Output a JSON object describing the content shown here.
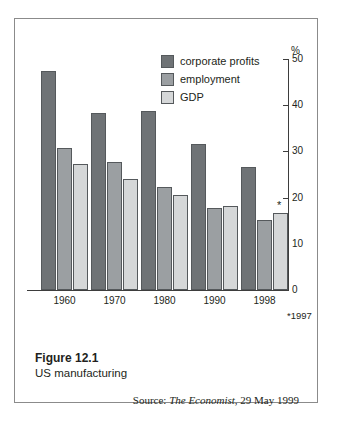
{
  "figure": {
    "number_label": "Figure 12.1",
    "subtitle": "US manufacturing",
    "source_prefix": "Source: ",
    "source_publication": "The Economist",
    "source_suffix": ", 29 May 1999"
  },
  "axis": {
    "unit_symbol": "%",
    "y_ticks": [
      "50",
      "40",
      "30",
      "20",
      "10",
      "0"
    ],
    "footnote": "*1997",
    "asterisk_marker": "*"
  },
  "legend": {
    "items": [
      {
        "label": "corporate profits",
        "color": "#6f7376"
      },
      {
        "label": "employment",
        "color": "#9b9fa2"
      },
      {
        "label": "GDP",
        "color": "#d5d7d8"
      }
    ]
  },
  "chart_data": {
    "type": "bar",
    "title": "US manufacturing",
    "xlabel": "",
    "ylabel": "%",
    "ylim": [
      0,
      50
    ],
    "yticks": [
      0,
      10,
      20,
      30,
      40,
      50
    ],
    "grid": false,
    "legend_position": "top-center",
    "categories": [
      "1960",
      "1970",
      "1980",
      "1990",
      "1998"
    ],
    "series": [
      {
        "name": "corporate profits",
        "color": "#6f7376",
        "values": [
          47.5,
          38.3,
          38.7,
          31.6,
          26.6
        ]
      },
      {
        "name": "employment",
        "color": "#9b9fa2",
        "values": [
          30.7,
          27.7,
          22.3,
          17.7,
          15.2
        ]
      },
      {
        "name": "GDP",
        "color": "#d5d7d8",
        "values": [
          27.3,
          24.0,
          20.6,
          18.2,
          16.7
        ]
      }
    ],
    "annotations": [
      {
        "text": "*",
        "category": "1998",
        "series": "GDP",
        "note": "*1997"
      }
    ],
    "source": "Source: The Economist, 29 May 1999"
  }
}
